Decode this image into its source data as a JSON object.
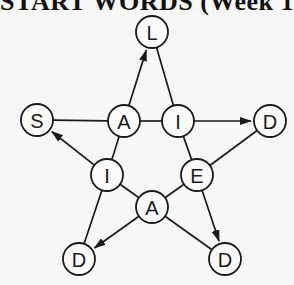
{
  "title": "START WORDS (Week 1",
  "diagram": {
    "type": "star-word-puzzle",
    "nodes": [
      {
        "id": "n_L",
        "letter": "L",
        "x": 152,
        "y": 32
      },
      {
        "id": "n_S",
        "letter": "S",
        "x": 37,
        "y": 120
      },
      {
        "id": "n_A1",
        "letter": "A",
        "x": 124,
        "y": 121
      },
      {
        "id": "n_I1",
        "letter": "I",
        "x": 178,
        "y": 121
      },
      {
        "id": "n_D1",
        "letter": "D",
        "x": 270,
        "y": 121
      },
      {
        "id": "n_I2",
        "letter": "I",
        "x": 107,
        "y": 175
      },
      {
        "id": "n_E",
        "letter": "E",
        "x": 197,
        "y": 175
      },
      {
        "id": "n_A2",
        "letter": "A",
        "x": 152,
        "y": 207
      },
      {
        "id": "n_D2",
        "letter": "D",
        "x": 79,
        "y": 259
      },
      {
        "id": "n_D3",
        "letter": "D",
        "x": 225,
        "y": 259
      }
    ],
    "edges": [
      {
        "from": "n_S",
        "to": "n_A1",
        "arrow": false
      },
      {
        "from": "n_A1",
        "to": "n_I1",
        "arrow": false
      },
      {
        "from": "n_I1",
        "to": "n_D1",
        "arrow": true
      },
      {
        "from": "n_A1",
        "to": "n_L",
        "arrow": true
      },
      {
        "from": "n_L",
        "to": "n_I1",
        "arrow": false
      },
      {
        "from": "n_A1",
        "to": "n_I2",
        "arrow": false
      },
      {
        "from": "n_I2",
        "to": "n_S",
        "arrow": true
      },
      {
        "from": "n_I1",
        "to": "n_E",
        "arrow": false
      },
      {
        "from": "n_D1",
        "to": "n_E",
        "arrow": false
      },
      {
        "from": "n_E",
        "to": "n_D3",
        "arrow": true
      },
      {
        "from": "n_I2",
        "to": "n_D2",
        "arrow": false
      },
      {
        "from": "n_I2",
        "to": "n_A2",
        "arrow": false
      },
      {
        "from": "n_A2",
        "to": "n_E",
        "arrow": false
      },
      {
        "from": "n_A2",
        "to": "n_D2",
        "arrow": true
      },
      {
        "from": "n_A2",
        "to": "n_D3",
        "arrow": false
      }
    ]
  },
  "node_radius": 16,
  "colors": {
    "stroke": "#1a1a1a",
    "background": "#f7f7f5"
  }
}
